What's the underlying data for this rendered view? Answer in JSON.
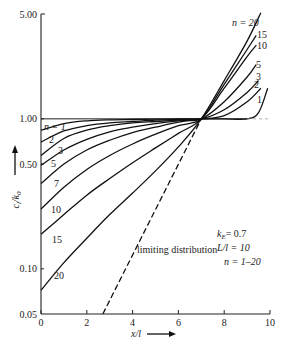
{
  "chart_data": {
    "type": "line",
    "title": "",
    "xlabel": "x/l",
    "ylabel": "c_l/k_0",
    "yscale": "log",
    "xlim": [
      0,
      10
    ],
    "ylim": [
      0.05,
      5.0
    ],
    "x_ticks": [
      "0",
      "2",
      "4",
      "6",
      "8",
      "10"
    ],
    "y_ticks": [
      "0.05",
      "0.10",
      "0.50",
      "1.00",
      "5.00"
    ],
    "grid": false,
    "parameters": {
      "k_E": "k_E = 0.7",
      "L_over_l": "L/l = 10",
      "n_range": "n = 1–20"
    },
    "annotations": [
      "limiting distribution",
      "n = 1",
      "n = 20"
    ],
    "series": [
      {
        "name": "n=1",
        "x": [
          0,
          1,
          2,
          3,
          4,
          5,
          6,
          7,
          8,
          9,
          9.5,
          9.9
        ],
        "y": [
          0.84,
          0.93,
          0.97,
          0.985,
          0.99,
          0.995,
          1.0,
          1.0,
          1.0,
          1.0,
          1.1,
          1.6
        ]
      },
      {
        "name": "n=2",
        "x": [
          0,
          1,
          2,
          3,
          4,
          5,
          6,
          7,
          8,
          9,
          9.6
        ],
        "y": [
          0.7,
          0.83,
          0.9,
          0.94,
          0.96,
          0.98,
          0.99,
          1.0,
          1.05,
          1.3,
          1.6
        ]
      },
      {
        "name": "n=3",
        "x": [
          0,
          1,
          2,
          3,
          4,
          5,
          6,
          7,
          8,
          9,
          9.5
        ],
        "y": [
          0.57,
          0.74,
          0.84,
          0.9,
          0.94,
          0.96,
          0.98,
          1.0,
          1.15,
          1.5,
          1.8
        ]
      },
      {
        "name": "n=5",
        "x": [
          0,
          1,
          2,
          3,
          4,
          5,
          6,
          7,
          8,
          9,
          9.4
        ],
        "y": [
          0.49,
          0.62,
          0.73,
          0.82,
          0.88,
          0.93,
          0.97,
          1.0,
          1.3,
          1.9,
          2.3
        ]
      },
      {
        "name": "n=7",
        "x": [
          0,
          1,
          2,
          3,
          4,
          5,
          6,
          7
        ],
        "y": [
          0.37,
          0.5,
          0.62,
          0.72,
          0.81,
          0.88,
          0.95,
          1.0
        ]
      },
      {
        "name": "n=10",
        "x": [
          0,
          1,
          2,
          3,
          4,
          5,
          6,
          7,
          8,
          9,
          9.4
        ],
        "y": [
          0.25,
          0.35,
          0.46,
          0.57,
          0.68,
          0.79,
          0.9,
          1.0,
          1.6,
          2.6,
          3.1
        ]
      },
      {
        "name": "n=15",
        "x": [
          0,
          1,
          2,
          3,
          4,
          5,
          6,
          7,
          8,
          9,
          9.4
        ],
        "y": [
          0.17,
          0.23,
          0.31,
          0.4,
          0.51,
          0.64,
          0.8,
          1.0,
          1.7,
          2.9,
          3.6
        ]
      },
      {
        "name": "n=20",
        "x": [
          0,
          1,
          2,
          3,
          4,
          5,
          6,
          7,
          8,
          9,
          9.6
        ],
        "y": [
          0.072,
          0.11,
          0.16,
          0.23,
          0.32,
          0.45,
          0.65,
          1.0,
          1.8,
          3.3,
          5.1
        ]
      },
      {
        "name": "limiting distribution",
        "style": "dashed",
        "x": [
          2.7,
          7.0
        ],
        "y": [
          0.05,
          1.0
        ]
      },
      {
        "name": "reference (c/k0 = 1)",
        "style": "dashed-light",
        "x": [
          9.0,
          10.0
        ],
        "y": [
          1.0,
          1.0
        ]
      }
    ]
  },
  "labels": {
    "y_arrow_label": "c_l/k_0",
    "x_axis_label": "x/l",
    "kE": "k",
    "kE_sub": "E",
    "kE_val": "= 0.7",
    "Ll": "L/l = 10",
    "nrange": "n = 1–20",
    "limiting": "limiting distribution",
    "n1": "n = 1",
    "n20": "n = 20",
    "curve_left_labels": [
      "2",
      "3",
      "5",
      "7",
      "10",
      "15",
      "20"
    ],
    "curve_right_labels": [
      "15",
      "10",
      "5",
      "3",
      "2",
      "1"
    ]
  }
}
